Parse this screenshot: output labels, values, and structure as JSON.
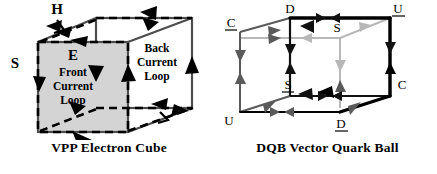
{
  "figure": {
    "panels": [
      {
        "id": "vpp-electron-cube",
        "caption": "VPP Electron Cube",
        "labels": {
          "h": "H",
          "e": "E",
          "s": "S",
          "front_loop_line1": "Front",
          "front_loop_line2": "Current",
          "front_loop_line3": "Loop",
          "back_loop_line1": "Back",
          "back_loop_line2": "Current",
          "back_loop_line3": "Loop"
        },
        "colors": {
          "solid_edge": "#4d4d4d",
          "dashed_edge": "#000000",
          "face_fill": "#d4d4d4",
          "text": "#000000"
        },
        "notes": {
          "front_face": "shaded gray square with dashed border = front current loop",
          "back_face": "white square outlined solid = back current loop"
        }
      },
      {
        "id": "dqb-vector-quark-ball",
        "caption": "DQB Vector Quark Ball",
        "vertices": [
          {
            "name": "C-bar",
            "text": "C",
            "underline": true,
            "position": "back-top-left"
          },
          {
            "name": "D",
            "text": "D",
            "underline": false,
            "position": "front-top-left"
          },
          {
            "name": "U-bar",
            "text": "U",
            "underline": true,
            "position": "front-top-right"
          },
          {
            "name": "S",
            "text": "S",
            "underline": false,
            "position": "back-top-right"
          },
          {
            "name": "U",
            "text": "U",
            "underline": false,
            "position": "back-bottom-left"
          },
          {
            "name": "S-bar",
            "text": "S",
            "underline": true,
            "position": "front-bottom-left"
          },
          {
            "name": "D-bar",
            "text": "D",
            "underline": true,
            "position": "front-bottom-right"
          },
          {
            "name": "C",
            "text": "C",
            "underline": false,
            "position": "back-bottom-right"
          }
        ],
        "colors": {
          "edge_dark": "#111111",
          "edge_mid": "#5a5a5a",
          "edge_light": "#b8b8b8",
          "edge_bold": "#000000",
          "text": "#000000"
        }
      }
    ]
  }
}
